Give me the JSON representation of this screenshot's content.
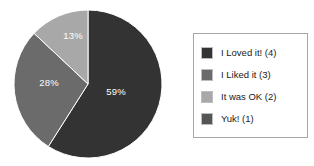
{
  "chart_data": {
    "type": "pie",
    "title": "",
    "categories": [
      "I Loved it! (4)",
      "I Liked it (3)",
      "It was OK (2)",
      "Yuk! (1)"
    ],
    "values": [
      59,
      28,
      13,
      0
    ],
    "value_unit": "%",
    "data_labels": [
      "59%",
      "28%",
      "13%",
      ""
    ],
    "colors": [
      "#333333",
      "#6b6b6b",
      "#a8a8a8",
      "#555555"
    ],
    "start_angle_deg": 0,
    "direction": "clockwise",
    "legend": {
      "position": "right",
      "border_color": "#a6a6a6",
      "background": "#ffffff",
      "entries": [
        {
          "label": "I Loved it! (4)",
          "color": "#333333"
        },
        {
          "label": "I Liked it (3)",
          "color": "#6b6b6b"
        },
        {
          "label": "It was OK (2)",
          "color": "#a8a8a8"
        },
        {
          "label": "Yuk! (1)",
          "color": "#555555"
        }
      ]
    },
    "grid": false,
    "xlabel": "",
    "ylabel": ""
  },
  "pie": {
    "labels": {
      "slice_0": "59%",
      "slice_1": "28%",
      "slice_2": "13%"
    }
  }
}
